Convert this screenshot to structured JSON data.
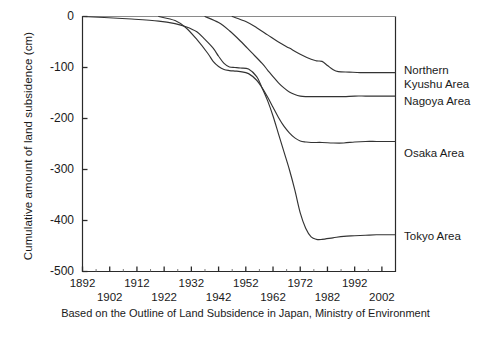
{
  "chart_data": {
    "type": "line",
    "title": "",
    "xlabel": "",
    "ylabel": "Cumulative amount of land subsidence (cm)",
    "xlim": [
      1892,
      2007
    ],
    "ylim": [
      -500,
      0
    ],
    "grid": false,
    "legend_position": "right-of-axes",
    "xticks": [
      1892,
      1902,
      1912,
      1922,
      1932,
      1942,
      1952,
      1962,
      1972,
      1982,
      1992,
      2002
    ],
    "xtick_labels": [
      "1892",
      "1902",
      "1912",
      "1922",
      "1932",
      "1942",
      "1952",
      "1962",
      "1972",
      "1982",
      "1992",
      "2002"
    ],
    "xtick_rows": [
      0,
      1,
      0,
      1,
      0,
      1,
      0,
      1,
      0,
      1,
      0,
      1
    ],
    "yticks": [
      0,
      -100,
      -200,
      -300,
      -400,
      -500
    ],
    "ytick_labels": [
      "0",
      "-100",
      "-200",
      "-300",
      "-400",
      "-500"
    ],
    "series": [
      {
        "name": "Tokyo Area",
        "label": "Tokyo Area",
        "color": "#333333",
        "x": [
          1892,
          1900,
          1910,
          1920,
          1926,
          1930,
          1934,
          1937,
          1940,
          1942,
          1944,
          1946,
          1948,
          1950,
          1953,
          1956,
          1958,
          1960,
          1962,
          1964,
          1966,
          1968,
          1970,
          1972,
          1974,
          1976,
          1978,
          1980,
          1984,
          1988,
          1992,
          1996,
          2000,
          2004,
          2007
        ],
        "values": [
          0,
          -2,
          -5,
          -9,
          -14,
          -20,
          -30,
          -45,
          -62,
          -78,
          -92,
          -99,
          -100,
          -101,
          -103,
          -118,
          -140,
          -165,
          -195,
          -230,
          -265,
          -300,
          -340,
          -385,
          -415,
          -432,
          -437,
          -437,
          -434,
          -431,
          -430,
          -429,
          -428,
          -428,
          -428
        ]
      },
      {
        "name": "Osaka Area",
        "label": "Osaka Area",
        "color": "#333333",
        "x": [
          1920,
          1926,
          1930,
          1934,
          1938,
          1940,
          1942,
          1944,
          1946,
          1948,
          1950,
          1953,
          1956,
          1958,
          1960,
          1962,
          1964,
          1966,
          1968,
          1970,
          1972,
          1974,
          1976,
          1980,
          1984,
          1988,
          1992,
          1996,
          2000,
          2004,
          2007
        ],
        "values": [
          0,
          -8,
          -22,
          -45,
          -72,
          -88,
          -98,
          -104,
          -106,
          -107,
          -108,
          -112,
          -125,
          -140,
          -158,
          -178,
          -198,
          -215,
          -228,
          -238,
          -244,
          -246,
          -247,
          -247,
          -248,
          -248,
          -246,
          -245,
          -245,
          -245,
          -245
        ]
      },
      {
        "name": "Nagoya Area",
        "label": "Nagoya Area",
        "color": "#333333",
        "x": [
          1937,
          1942,
          1946,
          1950,
          1954,
          1958,
          1960,
          1962,
          1964,
          1966,
          1968,
          1970,
          1972,
          1974,
          1976,
          1980,
          1984,
          1988,
          1992,
          1996,
          2000,
          2004,
          2007
        ],
        "values": [
          0,
          -12,
          -28,
          -48,
          -70,
          -92,
          -105,
          -118,
          -130,
          -140,
          -148,
          -153,
          -156,
          -157,
          -157,
          -157,
          -157,
          -157,
          -156,
          -156,
          -156,
          -156,
          -156
        ]
      },
      {
        "name": "Northern Kyushu Area",
        "label": "Northern\nKyushu Area",
        "color": "#333333",
        "x": [
          1947,
          1952,
          1956,
          1960,
          1964,
          1968,
          1972,
          1976,
          1978,
          1980,
          1982,
          1984,
          1986,
          1990,
          1994,
          1998,
          2002,
          2007
        ],
        "values": [
          0,
          -10,
          -22,
          -36,
          -50,
          -62,
          -74,
          -84,
          -87,
          -88,
          -96,
          -104,
          -108,
          -109,
          -110,
          -110,
          -110,
          -110
        ]
      }
    ],
    "caption": "Based on the Outline of Land Subsidence in Japan, Ministry of Environment",
    "series_label_y": {
      "Northern Kyushu Area": 64,
      "Nagoya Area": 95,
      "Osaka Area": 147,
      "Tokyo Area": 230
    }
  }
}
